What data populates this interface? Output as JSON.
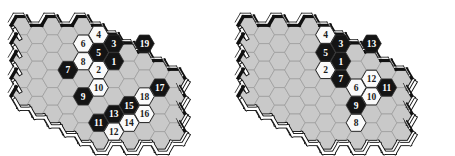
{
  "figure": {
    "type": "hex-game-board-pair",
    "colors": {
      "empty_cell": "#c9c9c9",
      "empty_cell_stroke": "#9a9a9a",
      "black_stone": "#141414",
      "white_stone": "#fafafa",
      "stone_stroke": "#2b2b2b",
      "border_dark": "#111111",
      "border_light": "#ffffff",
      "background": "#ffffff",
      "label_on_black": "#ffffff",
      "label_on_white": "#1a1a1a"
    },
    "geometry": {
      "hex_orientation": "flat-top",
      "hex_width": 20.4,
      "hex_height": 17.6,
      "col_step": 15.3,
      "row_step": 17.6,
      "rows": 7,
      "cols": 11
    }
  },
  "boards": [
    {
      "id": "board-left",
      "name": "left-board",
      "origin_x": 22,
      "origin_y": 26,
      "stones": [
        {
          "label": "1",
          "color": "black",
          "col": 6,
          "row": 2
        },
        {
          "label": "2",
          "color": "white",
          "col": 5,
          "row": 2
        },
        {
          "label": "3",
          "color": "black",
          "col": 6,
          "row": 1
        },
        {
          "label": "4",
          "color": "white",
          "col": 5,
          "row": 0
        },
        {
          "label": "5",
          "color": "black",
          "col": 5,
          "row": 1
        },
        {
          "label": "6",
          "color": "white",
          "col": 4,
          "row": 1
        },
        {
          "label": "7",
          "color": "black",
          "col": 3,
          "row": 2
        },
        {
          "label": "8",
          "color": "white",
          "col": 4,
          "row": 2
        },
        {
          "label": "9",
          "color": "black",
          "col": 4,
          "row": 4
        },
        {
          "label": "10",
          "color": "white",
          "col": 5,
          "row": 3
        },
        {
          "label": "11",
          "color": "black",
          "col": 5,
          "row": 5
        },
        {
          "label": "12",
          "color": "white",
          "col": 6,
          "row": 6
        },
        {
          "label": "13",
          "color": "black",
          "col": 6,
          "row": 5
        },
        {
          "label": "14",
          "color": "white",
          "col": 7,
          "row": 5
        },
        {
          "label": "15",
          "color": "black",
          "col": 7,
          "row": 4
        },
        {
          "label": "16",
          "color": "white",
          "col": 8,
          "row": 5
        },
        {
          "label": "17",
          "color": "black",
          "col": 9,
          "row": 3
        },
        {
          "label": "18",
          "color": "white",
          "col": 8,
          "row": 4
        },
        {
          "label": "19",
          "color": "black",
          "col": 8,
          "row": 1
        }
      ]
    },
    {
      "id": "board-right",
      "name": "right-board",
      "origin_x": 22,
      "origin_y": 26,
      "stones": [
        {
          "label": "1",
          "color": "black",
          "col": 6,
          "row": 2
        },
        {
          "label": "2",
          "color": "white",
          "col": 5,
          "row": 2
        },
        {
          "label": "3",
          "color": "black",
          "col": 6,
          "row": 1
        },
        {
          "label": "4",
          "color": "white",
          "col": 5,
          "row": 0
        },
        {
          "label": "5",
          "color": "black",
          "col": 5,
          "row": 1
        },
        {
          "label": "6",
          "color": "white",
          "col": 7,
          "row": 3
        },
        {
          "label": "7",
          "color": "black",
          "col": 6,
          "row": 3
        },
        {
          "label": "8",
          "color": "white",
          "col": 7,
          "row": 5
        },
        {
          "label": "9",
          "color": "black",
          "col": 7,
          "row": 4
        },
        {
          "label": "10",
          "color": "white",
          "col": 8,
          "row": 4
        },
        {
          "label": "11",
          "color": "black",
          "col": 9,
          "row": 3
        },
        {
          "label": "12",
          "color": "white",
          "col": 8,
          "row": 3
        },
        {
          "label": "13",
          "color": "black",
          "col": 8,
          "row": 1
        }
      ]
    }
  ]
}
